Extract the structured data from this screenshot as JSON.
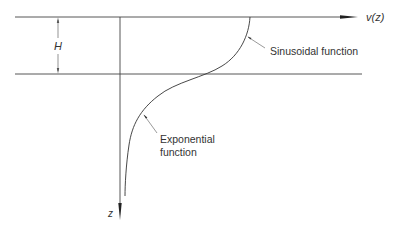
{
  "diagram": {
    "axes": {
      "horizontal_axis_label": "v(z)",
      "vertical_axis_label": "z"
    },
    "dimension": {
      "label": "H"
    },
    "annotations": {
      "sinusoidal": "Sinusoidal function",
      "exponential_line1": "Exponential",
      "exponential_line2": "function"
    },
    "colors": {
      "line": "#444444",
      "thin_line": "#555555",
      "text": "#333333",
      "background": "#ffffff"
    }
  }
}
